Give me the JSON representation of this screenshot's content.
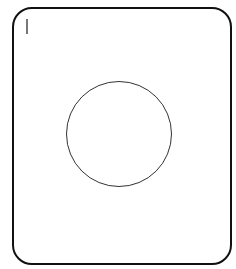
{
  "diagram": {
    "shapes": [
      {
        "type": "rounded-rectangle",
        "role": "outer-frame",
        "stroke": "#111111"
      },
      {
        "type": "vertical-bar",
        "role": "marker",
        "fill": "#777777"
      },
      {
        "type": "circle",
        "role": "center-circle",
        "stroke": "#333333"
      }
    ],
    "colors": {
      "background": "#ffffff",
      "frame_stroke": "#111111",
      "circle_stroke": "#333333",
      "marker": "#777777"
    }
  }
}
